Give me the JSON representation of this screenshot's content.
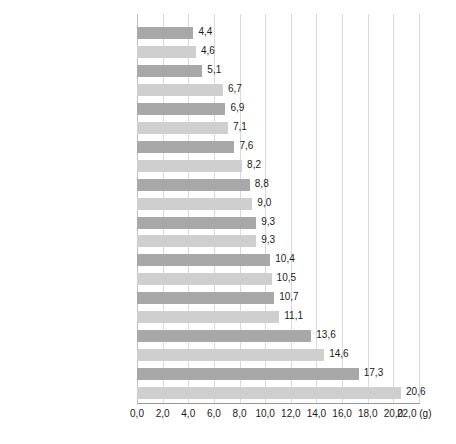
{
  "chart_data": {
    "type": "bar",
    "orientation": "horizontal",
    "title": "",
    "subtitle": "",
    "xlabel": "(g)",
    "ylabel": "",
    "xlim": [
      0.0,
      22.0
    ],
    "xticks": [
      "0,0",
      "2,0",
      "4,0",
      "6,0",
      "8,0",
      "10,0",
      "12,0",
      "14,0",
      "16,0",
      "18,0",
      "20,0",
      "22,0"
    ],
    "xtick_values": [
      0,
      2,
      4,
      6,
      8,
      10,
      12,
      14,
      16,
      18,
      20,
      22
    ],
    "unit_label": "(g)",
    "grid": "vertical",
    "legend": "none",
    "decimal_separator": ",",
    "categories": [
      "초콜렛, 10g",
      "요구르트(호상), 100g",
      "귤, 100g",
      "국수, 90g",
      "고구마, 70g",
      "과일음료, 100g",
      "수박, 150g",
      "우유, 200g",
      "사이다, 100g",
      "콜라, 100g",
      "복숭아, 100g",
      "설탕, 10g",
      "포도, 100g",
      "감, 100g",
      "탄산음료, 100g",
      "사과, 100g",
      "참외, 150g",
      "바나나, 100g",
      "아이스크림, 100g",
      "케이크, 90g"
    ],
    "values": [
      4.4,
      4.6,
      5.1,
      6.7,
      6.9,
      7.1,
      7.6,
      8.2,
      8.8,
      9.0,
      9.3,
      9.3,
      10.4,
      10.5,
      10.7,
      11.1,
      13.6,
      14.6,
      17.3,
      20.6
    ],
    "value_labels": [
      "4,4",
      "4,6",
      "5,1",
      "6,7",
      "6,9",
      "7,1",
      "7,6",
      "8,2",
      "8,8",
      "9,0",
      "9,3",
      "9,3",
      "10,4",
      "10,5",
      "10,7",
      "11,1",
      "13,6",
      "14,6",
      "17,3",
      "20,6"
    ],
    "bar_colors": {
      "dark": "#a8a8a8",
      "light": "#cfcfcf",
      "pattern": "alternating-odd-dark-even-light"
    },
    "gridline_color": "#d9d9d9",
    "axis_color": "#9a9a9a",
    "text_color": "#1a1a1a"
  }
}
